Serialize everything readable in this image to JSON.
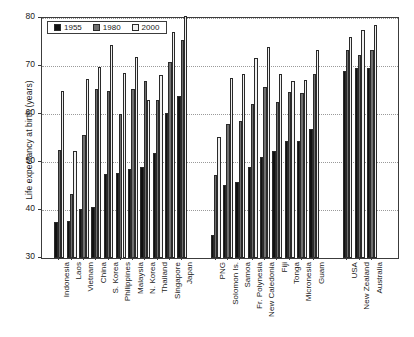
{
  "chart_data": {
    "type": "bar",
    "title": "",
    "subtitle": "",
    "xlabel": "",
    "ylabel": "Life expectancy at birth (years)",
    "ylim": [
      30,
      80
    ],
    "yticks": [
      30,
      40,
      50,
      60,
      70,
      80
    ],
    "grid": true,
    "legend_position": "top-left",
    "legend": [
      "1955",
      "1980",
      "2000"
    ],
    "categories": [
      "Indonesia",
      "Laos",
      "Vietnam",
      "China",
      "S. Korea",
      "Philippines",
      "Malaysia",
      "N. Korea",
      "Thailand",
      "Singapore",
      "Japan",
      "PNG",
      "Solomon Is.",
      "Samoa",
      "Fr. Polynesia",
      "New Caledonia",
      "Fiji",
      "Tonga",
      "Micronesia",
      "Guam",
      "USA",
      "New Zealand",
      "Australia"
    ],
    "group_breaks": [
      11,
      20
    ],
    "series": [
      {
        "name": "1955",
        "color": "#111111",
        "values": [
          37.5,
          37.8,
          40.3,
          40.6,
          47.4,
          47.8,
          48.5,
          49.0,
          51.8,
          60.2,
          63.8,
          34.7,
          45.2,
          45.8,
          48.9,
          51.1,
          52.3,
          54.3,
          54.3,
          56.8,
          69.0,
          69.5,
          69.5
        ]
      },
      {
        "name": "1980",
        "color": "#6f6f6f",
        "values": [
          52.5,
          43.4,
          55.6,
          65.3,
          64.7,
          59.9,
          65.3,
          66.8,
          63.0,
          70.8,
          75.5,
          47.2,
          57.9,
          58.5,
          62.1,
          65.7,
          62.4,
          64.5,
          64.4,
          68.4,
          73.3,
          72.3,
          73.3
        ]
      },
      {
        "name": "2000",
        "color": "#f0f0f0",
        "values": [
          64.8,
          52.3,
          67.2,
          69.8,
          74.3,
          68.6,
          71.8,
          62.9,
          68.2,
          77.1,
          80.5,
          55.3,
          67.4,
          68.3,
          71.7,
          73.9,
          68.4,
          66.8,
          67.0,
          73.3,
          76.1,
          77.4,
          78.5
        ]
      }
    ]
  }
}
